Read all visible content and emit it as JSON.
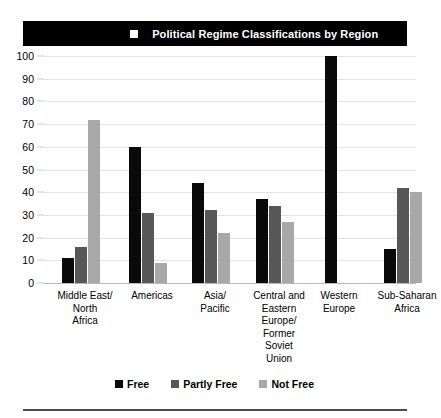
{
  "figure": {
    "number": "FIGURE 7.9",
    "square_glyph": "white-square",
    "title": "Political Regime Classifications by Region"
  },
  "chart_data": {
    "type": "bar",
    "title": "Political Regime Classifications by Region",
    "xlabel": "",
    "ylabel": "",
    "ylim": [
      0,
      100
    ],
    "yticks": [
      0,
      10,
      20,
      30,
      40,
      50,
      60,
      70,
      80,
      90,
      100
    ],
    "grid": true,
    "legend_position": "bottom",
    "categories": [
      "Middle East/\nNorth\nAfrica",
      "Americas",
      "Asia/\nPacific",
      "Central and\nEastern\nEurope/\nFormer\nSoviet\nUnion",
      "Western\nEurope",
      "Sub-Saharan\nAfrica"
    ],
    "series": [
      {
        "name": "Free",
        "color": "#0a0a0a",
        "values": [
          11,
          60,
          44,
          37,
          100,
          15
        ]
      },
      {
        "name": "Partly Free",
        "color": "#585858",
        "values": [
          16,
          31,
          32,
          34,
          0,
          42
        ]
      },
      {
        "name": "Not Free",
        "color": "#a8a8a8",
        "values": [
          72,
          9,
          22,
          27,
          0,
          40
        ]
      }
    ]
  },
  "legend": {
    "items": [
      {
        "label": "Free",
        "key": "free"
      },
      {
        "label": "Partly Free",
        "key": "partly"
      },
      {
        "label": "Not Free",
        "key": "notfree"
      }
    ]
  }
}
